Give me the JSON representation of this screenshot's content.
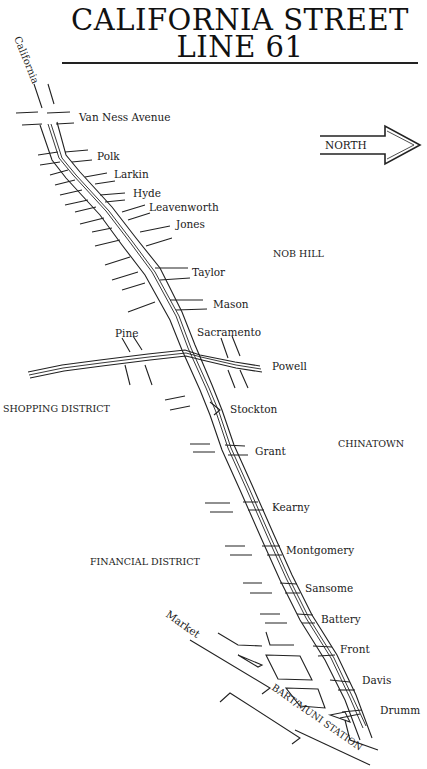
{
  "header": {
    "title_line1": "CALIFORNIA STREET",
    "title_line2": "LINE 61"
  },
  "north_arrow": {
    "label": "NORTH"
  },
  "route": {
    "name": "California"
  },
  "streets": [
    "Van Ness Avenue",
    "Polk",
    "Larkin",
    "Hyde",
    "Leavenworth",
    "Jones",
    "Taylor",
    "Mason",
    "Pine",
    "Sacramento",
    "Powell",
    "Stockton",
    "Grant",
    "Kearny",
    "Montgomery",
    "Sansome",
    "Battery",
    "Front",
    "Davis",
    "Drumm",
    "Market"
  ],
  "districts": {
    "nob_hill": "NOB HILL",
    "shopping": "SHOPPING DISTRICT",
    "chinatown": "CHINATOWN",
    "financial": "FINANCIAL DISTRICT"
  },
  "station": {
    "label": "BART/MUNI STATION"
  }
}
